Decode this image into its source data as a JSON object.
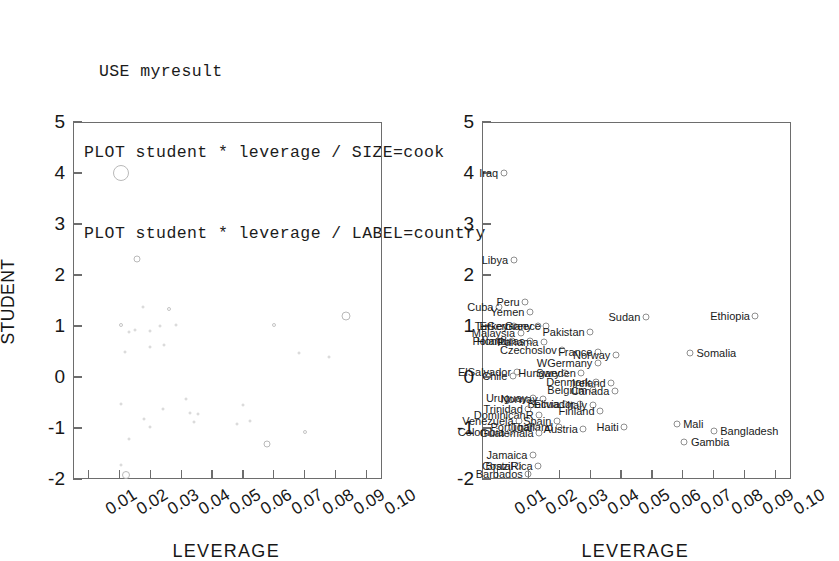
{
  "code": {
    "lines": [
      "USE myresult",
      "PLOT student * leverage / SIZE=cook",
      "PLOT student * leverage / LABEL=country"
    ]
  },
  "chart_data": [
    {
      "type": "scatter",
      "panel": "left",
      "title": "",
      "xlabel": "LEVERAGE",
      "ylabel": "STUDENT",
      "xlim": [
        0.005,
        0.105
      ],
      "ylim": [
        -2,
        5
      ],
      "xticks": [
        "0.01",
        "0.02",
        "0.03",
        "0.04",
        "0.05",
        "0.06",
        "0.07",
        "0.08",
        "0.09",
        "0.10"
      ],
      "xtick_values": [
        0.01,
        0.02,
        0.03,
        0.04,
        0.05,
        0.06,
        0.07,
        0.08,
        0.09,
        0.1
      ],
      "yticks": [
        "5",
        "4",
        "3",
        "2",
        "1",
        "0",
        "-1",
        "-2"
      ],
      "ytick_values": [
        5,
        4,
        3,
        2,
        1,
        0,
        -1,
        -2
      ],
      "grid": false,
      "legend": "none",
      "size_encoding": "cook",
      "points": [
        {
          "x": 0.0205,
          "y": 4.0,
          "size": 16
        },
        {
          "x": 0.0258,
          "y": 2.32,
          "size": 7
        },
        {
          "x": 0.0278,
          "y": 1.38,
          "size": 3
        },
        {
          "x": 0.0205,
          "y": 1.02,
          "size": 4
        },
        {
          "x": 0.0232,
          "y": 0.88,
          "size": 3
        },
        {
          "x": 0.025,
          "y": 0.93,
          "size": 3
        },
        {
          "x": 0.03,
          "y": 0.9,
          "size": 3
        },
        {
          "x": 0.033,
          "y": 1.0,
          "size": 3
        },
        {
          "x": 0.036,
          "y": 1.33,
          "size": 4
        },
        {
          "x": 0.0382,
          "y": 1.02,
          "size": 3
        },
        {
          "x": 0.03,
          "y": 0.58,
          "size": 3
        },
        {
          "x": 0.0345,
          "y": 0.62,
          "size": 3
        },
        {
          "x": 0.0218,
          "y": 0.5,
          "size": 3
        },
        {
          "x": 0.07,
          "y": 1.01,
          "size": 4
        },
        {
          "x": 0.0935,
          "y": 1.2,
          "size": 9
        },
        {
          "x": 0.078,
          "y": 0.48,
          "size": 3
        },
        {
          "x": 0.088,
          "y": 0.4,
          "size": 3
        },
        {
          "x": 0.0205,
          "y": -0.52,
          "size": 3
        },
        {
          "x": 0.034,
          "y": -0.63,
          "size": 3
        },
        {
          "x": 0.0415,
          "y": -0.44,
          "size": 3
        },
        {
          "x": 0.043,
          "y": -0.7,
          "size": 3
        },
        {
          "x": 0.0455,
          "y": -0.72,
          "size": 3
        },
        {
          "x": 0.0443,
          "y": -0.88,
          "size": 3
        },
        {
          "x": 0.028,
          "y": -0.82,
          "size": 3
        },
        {
          "x": 0.0298,
          "y": -0.98,
          "size": 3
        },
        {
          "x": 0.0232,
          "y": -1.22,
          "size": 3
        },
        {
          "x": 0.06,
          "y": -0.55,
          "size": 3
        },
        {
          "x": 0.0582,
          "y": -0.93,
          "size": 3
        },
        {
          "x": 0.0623,
          "y": -0.87,
          "size": 3
        },
        {
          "x": 0.0678,
          "y": -1.31,
          "size": 7
        },
        {
          "x": 0.08,
          "y": -1.07,
          "size": 4
        },
        {
          "x": 0.0205,
          "y": -1.72,
          "size": 3
        },
        {
          "x": 0.0222,
          "y": -1.92,
          "size": 8
        }
      ]
    },
    {
      "type": "scatter",
      "panel": "right",
      "title": "",
      "xlabel": "LEVERAGE",
      "ylabel": "",
      "xlim": [
        0.005,
        0.105
      ],
      "ylim": [
        -2,
        5
      ],
      "xticks": [
        "0.01",
        "0.02",
        "0.03",
        "0.04",
        "0.05",
        "0.06",
        "0.07",
        "0.08",
        "0.09",
        "0.10"
      ],
      "xtick_values": [
        0.01,
        0.02,
        0.03,
        0.04,
        0.05,
        0.06,
        0.07,
        0.08,
        0.09,
        0.1
      ],
      "yticks": [
        "5",
        "4",
        "3",
        "2",
        "1",
        "0",
        "-1",
        "-2"
      ],
      "ytick_values": [
        5,
        4,
        3,
        2,
        1,
        0,
        -1,
        -2
      ],
      "grid": false,
      "legend": "none",
      "label_encoding": "country",
      "points": [
        {
          "x": 0.012,
          "y": 4.0,
          "label": "Iraq",
          "side": "left"
        },
        {
          "x": 0.0152,
          "y": 2.3,
          "label": "Libya",
          "side": "left"
        },
        {
          "x": 0.0105,
          "y": 1.38,
          "label": "Cuba",
          "side": "left"
        },
        {
          "x": 0.019,
          "y": 1.48,
          "label": "Peru",
          "side": "left"
        },
        {
          "x": 0.0205,
          "y": 1.28,
          "label": "Yemen",
          "side": "left"
        },
        {
          "x": 0.058,
          "y": 1.18,
          "label": "Sudan",
          "side": "left"
        },
        {
          "x": 0.0935,
          "y": 1.2,
          "label": "Ethiopia",
          "side": "left"
        },
        {
          "x": 0.0152,
          "y": 1.0,
          "label": "Turkey",
          "side": "left"
        },
        {
          "x": 0.023,
          "y": 1.0,
          "label": "EGermany",
          "side": "left"
        },
        {
          "x": 0.0258,
          "y": 1.0,
          "label": "Greece",
          "side": "left"
        },
        {
          "x": 0.0175,
          "y": 0.86,
          "label": "Malaysia",
          "side": "left"
        },
        {
          "x": 0.04,
          "y": 0.88,
          "label": "Pakistan",
          "side": "left"
        },
        {
          "x": 0.0148,
          "y": 0.7,
          "label": "Poland",
          "side": "left"
        },
        {
          "x": 0.0205,
          "y": 0.7,
          "label": "Honduras",
          "side": "left"
        },
        {
          "x": 0.025,
          "y": 0.68,
          "label": "Panama",
          "side": "left"
        },
        {
          "x": 0.031,
          "y": 0.52,
          "label": "Czechoslov",
          "side": "left"
        },
        {
          "x": 0.0425,
          "y": 0.5,
          "label": "France",
          "side": "left"
        },
        {
          "x": 0.0483,
          "y": 0.44,
          "label": "Norway",
          "side": "left"
        },
        {
          "x": 0.0723,
          "y": 0.48,
          "label": "Somalia",
          "side": "right"
        },
        {
          "x": 0.0162,
          "y": 0.1,
          "label": "ElSalvador",
          "side": "left"
        },
        {
          "x": 0.0425,
          "y": 0.28,
          "label": "WGermany",
          "side": "left"
        },
        {
          "x": 0.032,
          "y": 0.08,
          "label": "Hungary",
          "side": "left"
        },
        {
          "x": 0.0372,
          "y": 0.08,
          "label": "Sweden",
          "side": "left"
        },
        {
          "x": 0.015,
          "y": 0.02,
          "label": "Chile",
          "side": "left"
        },
        {
          "x": 0.042,
          "y": -0.1,
          "label": "Denmark",
          "side": "left"
        },
        {
          "x": 0.0468,
          "y": -0.12,
          "label": "Ireland",
          "side": "left"
        },
        {
          "x": 0.0408,
          "y": -0.26,
          "label": "Belgium",
          "side": "left"
        },
        {
          "x": 0.048,
          "y": -0.28,
          "label": "Canada",
          "side": "left"
        },
        {
          "x": 0.0215,
          "y": -0.42,
          "label": "Uruguay",
          "side": "left"
        },
        {
          "x": 0.0248,
          "y": -0.44,
          "label": "Norway",
          "side": "left"
        },
        {
          "x": 0.032,
          "y": -0.52,
          "label": "Bolivia",
          "side": "left"
        },
        {
          "x": 0.0368,
          "y": -0.52,
          "label": "Ecuador",
          "side": "left"
        },
        {
          "x": 0.0408,
          "y": -0.54,
          "label": "Italy",
          "side": "left"
        },
        {
          "x": 0.02,
          "y": -0.62,
          "label": "Trinidad",
          "side": "left"
        },
        {
          "x": 0.0432,
          "y": -0.66,
          "label": "Finland",
          "side": "left"
        },
        {
          "x": 0.0235,
          "y": -0.74,
          "label": "DominicanR",
          "side": "left"
        },
        {
          "x": 0.017,
          "y": -0.86,
          "label": "Venezuela",
          "side": "left"
        },
        {
          "x": 0.0292,
          "y": -0.86,
          "label": "Spain",
          "side": "left"
        },
        {
          "x": 0.0228,
          "y": -0.98,
          "label": "Portugal",
          "side": "left"
        },
        {
          "x": 0.0298,
          "y": -0.98,
          "label": "Thailand",
          "side": "left"
        },
        {
          "x": 0.0378,
          "y": -1.02,
          "label": "Austria",
          "side": "left"
        },
        {
          "x": 0.051,
          "y": -0.98,
          "label": "Haiti",
          "side": "left"
        },
        {
          "x": 0.014,
          "y": -1.08,
          "label": "Colombia",
          "side": "left"
        },
        {
          "x": 0.0235,
          "y": -1.1,
          "label": "Guatemala",
          "side": "left"
        },
        {
          "x": 0.068,
          "y": -0.92,
          "label": "Mali",
          "side": "right"
        },
        {
          "x": 0.08,
          "y": -1.05,
          "label": "Bangladesh",
          "side": "right"
        },
        {
          "x": 0.0705,
          "y": -1.28,
          "label": "Gambia",
          "side": "right"
        },
        {
          "x": 0.0215,
          "y": -1.52,
          "label": "Jamaica",
          "side": "left"
        },
        {
          "x": 0.0168,
          "y": -1.75,
          "label": "Brazil",
          "side": "left"
        },
        {
          "x": 0.0232,
          "y": -1.75,
          "label": "CostaRica",
          "side": "left"
        },
        {
          "x": 0.02,
          "y": -1.9,
          "label": "Barbados",
          "side": "left"
        }
      ]
    }
  ]
}
